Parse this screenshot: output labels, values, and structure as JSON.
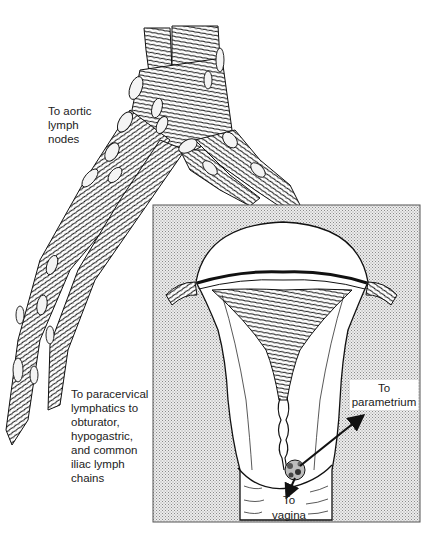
{
  "figure": {
    "labels": {
      "aortic": "To aortic\nlymph\nnodes",
      "paracervical": "To paracervical\nlymphatics to\nobturator,\nhypogastric,\nand common\niliac lymph\nchains",
      "parametrium": "To\nparametrium",
      "vagina": "To\nvagina"
    },
    "structures": {
      "vessels": "lymphatic-vessel-tree",
      "inset": "uterus-cervix-inset",
      "lesion": "cervical-tumor"
    },
    "colors": {
      "ink": "#111111",
      "stipple": "#c8c8c8",
      "inset_bg": "#e4e4e4",
      "background": "#ffffff"
    }
  }
}
